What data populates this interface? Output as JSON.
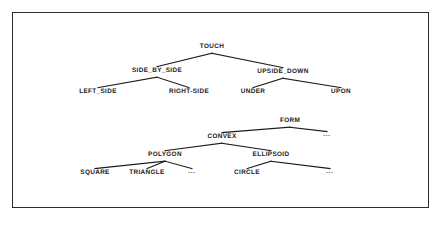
{
  "figure": {
    "frame": {
      "x": 12,
      "y": 12,
      "width": 417,
      "height": 196,
      "stroke_color": "#2b2b2b"
    },
    "background_color": "#ffffff",
    "line_color": "#1a1a1a"
  },
  "chart_data": {
    "type": "diagram",
    "title": "",
    "subtitle": "",
    "xlabel": "",
    "ylabel": "",
    "diagram_kind": "hierarchy-tree",
    "trees": [
      {
        "name": "spatial-relations-tree",
        "root": "TOUCH",
        "nodes": [
          {
            "id": "TOUCH",
            "label": "TOUCH",
            "x": 212,
            "y": 48,
            "level": 0
          },
          {
            "id": "SIDE_BY_SIDE",
            "label": "SIDE_BY_SIDE",
            "x": 157,
            "y": 72,
            "level": 1
          },
          {
            "id": "UPSIDE_DOWN",
            "label": "UPSIDE_DOWN",
            "x": 283,
            "y": 73,
            "level": 1
          },
          {
            "id": "LEFT_SIDE",
            "label": "LEFT_SIDE",
            "x": 98,
            "y": 93,
            "level": 2
          },
          {
            "id": "RIGHT-SIDE",
            "label": "RIGHT-SIDE",
            "x": 189,
            "y": 93,
            "level": 2
          },
          {
            "id": "UNDER",
            "label": "UNDER",
            "x": 253,
            "y": 93,
            "level": 2
          },
          {
            "id": "UPON",
            "label": "UPON",
            "x": 341,
            "y": 93,
            "level": 2
          }
        ],
        "edges": [
          {
            "from": "TOUCH",
            "to": "SIDE_BY_SIDE"
          },
          {
            "from": "TOUCH",
            "to": "UPSIDE_DOWN"
          },
          {
            "from": "SIDE_BY_SIDE",
            "to": "LEFT_SIDE"
          },
          {
            "from": "SIDE_BY_SIDE",
            "to": "RIGHT-SIDE"
          },
          {
            "from": "UPSIDE_DOWN",
            "to": "UNDER"
          },
          {
            "from": "UPSIDE_DOWN",
            "to": "UPON"
          }
        ]
      },
      {
        "name": "form-shape-tree",
        "root": "FORM",
        "nodes": [
          {
            "id": "FORM",
            "label": "FORM",
            "x": 290,
            "y": 122,
            "level": 0
          },
          {
            "id": "CONVEX",
            "label": "CONVEX",
            "x": 222,
            "y": 138,
            "level": 1
          },
          {
            "id": "FORM_ELLIPSIS",
            "label": "...",
            "x": 327,
            "y": 137,
            "level": 1
          },
          {
            "id": "POLYGON",
            "label": "POLYGON",
            "x": 165,
            "y": 156,
            "level": 2
          },
          {
            "id": "ELLIPSOID",
            "label": "ELLIPSOID",
            "x": 271,
            "y": 156,
            "level": 2
          },
          {
            "id": "SQUARE",
            "label": "SQUARE",
            "x": 95,
            "y": 174,
            "level": 3
          },
          {
            "id": "TRIANGLE",
            "label": "TRIANGLE",
            "x": 147,
            "y": 174,
            "level": 3
          },
          {
            "id": "POLYGON_ELLIPSIS",
            "label": "...",
            "x": 192,
            "y": 174,
            "level": 3
          },
          {
            "id": "CIRCLE",
            "label": "CIRCLE",
            "x": 247,
            "y": 174,
            "level": 3
          },
          {
            "id": "ELLIPSOID_ELLIPSIS",
            "label": "...",
            "x": 330,
            "y": 174,
            "level": 3
          }
        ],
        "edges": [
          {
            "from": "FORM",
            "to": "CONVEX"
          },
          {
            "from": "FORM",
            "to": "FORM_ELLIPSIS"
          },
          {
            "from": "CONVEX",
            "to": "POLYGON"
          },
          {
            "from": "CONVEX",
            "to": "ELLIPSOID"
          },
          {
            "from": "POLYGON",
            "to": "SQUARE"
          },
          {
            "from": "POLYGON",
            "to": "TRIANGLE"
          },
          {
            "from": "POLYGON",
            "to": "POLYGON_ELLIPSIS"
          },
          {
            "from": "ELLIPSOID",
            "to": "CIRCLE"
          },
          {
            "from": "ELLIPSOID",
            "to": "ELLIPSOID_ELLIPSIS"
          }
        ]
      }
    ]
  }
}
